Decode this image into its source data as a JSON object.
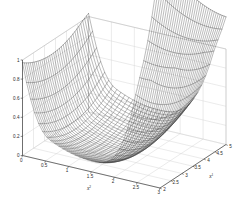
{
  "figure": {
    "background_color": "#ffffff",
    "axis_color": "#3a3a3a",
    "grid_color": "#d2d2d2",
    "mesh_color": "#1e1e1e",
    "width": 252,
    "height": 217
  },
  "chart_data": {
    "type": "line",
    "plot_kind": "3d-mesh-surface",
    "title": "",
    "xlabel": "x",
    "xlabel_superscript": "2",
    "ylabel": "x",
    "ylabel_superscript": "1",
    "zlabel": "",
    "xlim": [
      0,
      3
    ],
    "ylim": [
      2,
      5
    ],
    "zlim": [
      0,
      1
    ],
    "x_ticks": [
      0,
      0.5,
      1,
      1.5,
      2,
      2.5,
      3
    ],
    "x_tick_labels": [
      "0",
      "0.5",
      "1",
      "1.5",
      "2",
      "2.5",
      "3"
    ],
    "y_ticks": [
      2,
      2.5,
      3,
      3.5,
      4,
      4.5,
      5
    ],
    "y_tick_labels": [
      "2",
      "2.5",
      "3",
      "3.5",
      "4",
      "4.5",
      "5"
    ],
    "z_ticks": [
      0,
      0.2,
      0.4,
      0.6,
      0.8,
      1
    ],
    "z_tick_labels": [
      "0",
      "0.2",
      "0.4",
      "0.6",
      "0.8",
      "1"
    ],
    "grid": true,
    "legend": "none",
    "view_azimuth_deg": -37.5,
    "view_elevation_deg": 30,
    "mesh_nx": 34,
    "mesh_ny": 34,
    "surface_description": "Smooth valley/bowl surface, near zero in the central basin, rising steeply to clipped spikes above z=1 along the high-x2 / low-x1 edge",
    "surface_model": {
      "basin_x": 1.55,
      "basin_y": 3.3,
      "bowl_scale": 0.105,
      "spike_edge": "x2-max",
      "spike_gain": 2.4,
      "clip_z": 1.0
    }
  },
  "axis_labels": {
    "x_base": "x",
    "x_sup": "2",
    "y_base": "x",
    "y_sup": "1"
  }
}
